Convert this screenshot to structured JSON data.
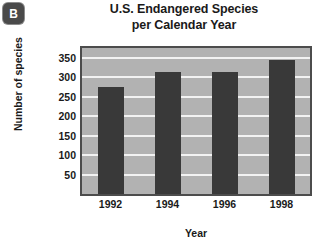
{
  "panel": {
    "letter": "B",
    "badge_color": "#4a4a4a"
  },
  "title": {
    "line1": "U.S. Endangered Species",
    "line2": "per Calendar Year"
  },
  "chart_data": {
    "type": "bar",
    "title": "U.S. Endangered Species per Calendar Year",
    "xlabel": "Year",
    "ylabel": "Number of species",
    "categories": [
      "1992",
      "1994",
      "1996",
      "1998"
    ],
    "values": [
      275,
      313,
      313,
      345
    ],
    "ylim": [
      0,
      375
    ],
    "yticks": [
      50,
      100,
      150,
      200,
      250,
      300,
      350
    ],
    "ytick_labels": [
      "50",
      "100",
      "150",
      "200",
      "250",
      "300",
      "350"
    ],
    "grid": true,
    "grid_axis": "y",
    "grid_color": "#f2f2f2",
    "legend": "none",
    "bar_color": "#393939",
    "plot_background": "#b2b2b2",
    "frame_color": "#4c4c4c"
  }
}
